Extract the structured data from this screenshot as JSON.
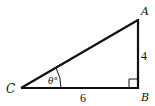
{
  "diagram": {
    "type": "right-triangle",
    "vertices": [
      {
        "id": "A",
        "label": "A"
      },
      {
        "id": "B",
        "label": "B"
      },
      {
        "id": "C",
        "label": "C"
      }
    ],
    "sides": [
      {
        "id": "AB",
        "label": "4"
      },
      {
        "id": "CB",
        "label": "6"
      },
      {
        "id": "CA",
        "label": ""
      }
    ],
    "angle_label": "θ°",
    "right_angle_at": "B",
    "stroke_color": "#111111"
  }
}
